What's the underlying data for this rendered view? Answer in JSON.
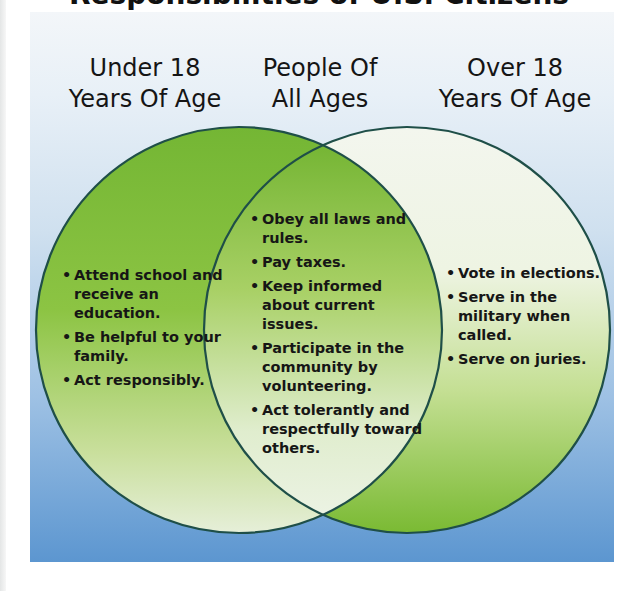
{
  "title": "Responsibilities of U.S. Citizens",
  "colors": {
    "panel_top": "#f3f6f9",
    "panel_bottom": "#5c96d0",
    "green": "#7dbd3a",
    "pale_green": "#eef4e4",
    "outline": "#1f4f48"
  },
  "headers": {
    "left": {
      "line1": "Under 18",
      "line2": "Years Of Age"
    },
    "center": {
      "line1": "People Of",
      "line2": "All Ages"
    },
    "right": {
      "line1": "Over 18",
      "line2": "Years Of Age"
    }
  },
  "lists": {
    "under18": [
      "Attend school and receive an education.",
      "Be helpful to your family.",
      "Act responsibly."
    ],
    "all_ages": [
      "Obey all laws and rules.",
      "Pay taxes.",
      "Keep informed about current issues.",
      "Participate in the community by volunteering.",
      "Act tolerantly and respectfully toward others."
    ],
    "over18": [
      "Vote in elections.",
      "Serve in the military when called.",
      "Serve on juries."
    ]
  }
}
